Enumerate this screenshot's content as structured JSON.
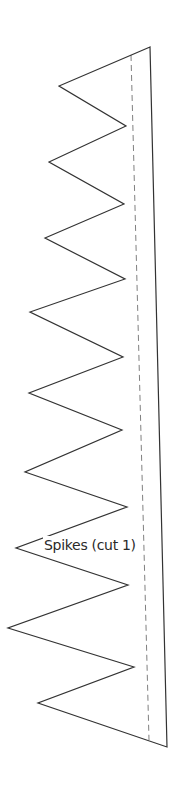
{
  "pattern": {
    "label": "Spikes (cut 1)",
    "colors": {
      "cut_line": "#333333",
      "fold_line": "#808080",
      "background": "#ffffff"
    },
    "outline_points": [
      [
        150,
        47
      ],
      [
        59,
        86
      ],
      [
        126,
        126
      ],
      [
        49,
        162
      ],
      [
        124,
        204
      ],
      [
        45,
        238
      ],
      [
        125,
        279
      ],
      [
        30,
        312
      ],
      [
        123,
        357
      ],
      [
        29,
        393
      ],
      [
        122,
        430
      ],
      [
        25,
        472
      ],
      [
        127,
        507
      ],
      [
        16,
        548
      ],
      [
        128,
        585
      ],
      [
        8,
        628
      ],
      [
        134,
        667
      ],
      [
        38,
        703
      ],
      [
        167,
        747
      ]
    ],
    "dashed_line": {
      "x1": 131,
      "y1": 55,
      "x2": 149,
      "y2": 740
    }
  }
}
